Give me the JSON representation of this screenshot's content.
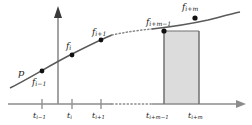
{
  "figure": {
    "kind": "mathematical-diagram",
    "curve_label": "p",
    "axes": {
      "vertical_axis_name": "value-axis",
      "horizontal_axis_name": "t-axis",
      "origin_x": 58,
      "baseline_y": 104
    },
    "colors": {
      "axis": "#8c8c8c",
      "curve": "#5a5a5a",
      "point": "#111111",
      "text": "#1a1a1a",
      "panel_fill": "#dcdcdc",
      "panel_edge": "#707070",
      "background": "#ffffff"
    },
    "function_labels": [
      {
        "id": "f-i-minus-1",
        "base": "f",
        "sub": "i−1",
        "x": 32,
        "y": 78,
        "point_x": 42,
        "point_y": 71
      },
      {
        "id": "f-i",
        "base": "f",
        "sub": "i",
        "x": 66,
        "y": 42,
        "point_x": 72,
        "point_y": 55
      },
      {
        "id": "f-i-plus-1",
        "base": "f",
        "sub": "i+1",
        "x": 92,
        "y": 28,
        "point_x": 101,
        "point_y": 40
      },
      {
        "id": "f-i-plus-m-minus-1",
        "base": "f",
        "sub": "i+m−1",
        "x": 146,
        "y": 18,
        "point_x": 164,
        "point_y": 31
      },
      {
        "id": "f-i-plus-m",
        "base": "f",
        "sub": "i+m",
        "x": 182,
        "y": 3,
        "point_x": 195,
        "point_y": 18
      }
    ],
    "tick_labels": [
      {
        "id": "t-i-minus-1",
        "base": "t",
        "sub": "i−1",
        "x": 33,
        "y": 112,
        "tick_x": 42
      },
      {
        "id": "t-i",
        "base": "t",
        "sub": "i",
        "x": 67,
        "y": 112,
        "tick_x": 72
      },
      {
        "id": "t-i-plus-1",
        "base": "t",
        "sub": "i+1",
        "x": 92,
        "y": 112,
        "tick_x": 101
      },
      {
        "id": "t-i-plus-m-minus-1",
        "base": "t",
        "sub": "i+m−1",
        "x": 146,
        "y": 112,
        "tick_x": 164
      },
      {
        "id": "t-i-plus-m",
        "base": "t",
        "sub": "i+m",
        "x": 188,
        "y": 112,
        "tick_x": 199
      }
    ],
    "shaded_panel": {
      "name": "shaded-interval-panel",
      "x_left": 164,
      "x_right": 199,
      "y_top": 31,
      "y_bottom": 104
    },
    "dotted_gap_axis": {
      "x_start": 112,
      "x_end": 152,
      "y": 104
    },
    "dotted_gap_curve": {
      "x_start": 112,
      "x_end": 152
    }
  }
}
